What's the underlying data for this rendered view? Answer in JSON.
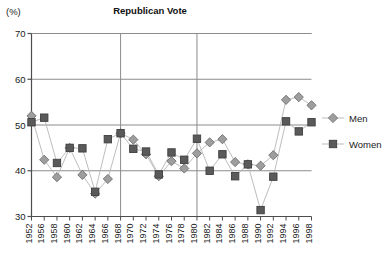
{
  "chart_data": {
    "type": "line",
    "title": "Republican Vote",
    "ylabel": "(%)",
    "xlabel": "",
    "ylim": [
      30,
      70
    ],
    "yticks": [
      30,
      40,
      50,
      60,
      70
    ],
    "grid": true,
    "legend_position": "right",
    "categories": [
      "1952",
      "1956",
      "1958",
      "1960",
      "1962",
      "1964",
      "1966",
      "1968",
      "1970",
      "1972",
      "1974",
      "1976",
      "1978",
      "1980",
      "1982",
      "1984",
      "1986",
      "1988",
      "1990",
      "1992",
      "1994",
      "1996",
      "1998"
    ],
    "series": [
      {
        "name": "Men",
        "marker": "diamond",
        "color": "#9e9e9e",
        "values": [
          52.0,
          42.4,
          38.6,
          45.0,
          39.1,
          35.0,
          38.2,
          48.2,
          46.8,
          43.6,
          38.8,
          42.1,
          40.5,
          43.8,
          46.2,
          46.9,
          41.9,
          41.4,
          41.1,
          43.4,
          55.5,
          56.1,
          54.3
        ]
      },
      {
        "name": "Women",
        "marker": "square",
        "color": "#5a5a5a",
        "values": [
          50.6,
          51.6,
          41.7,
          45.0,
          44.9,
          35.4,
          46.9,
          48.2,
          44.8,
          44.2,
          39.2,
          44.0,
          42.4,
          47.0,
          40.0,
          43.6,
          38.8,
          41.4,
          31.4,
          38.7,
          50.8,
          48.6,
          50.6
        ]
      }
    ],
    "reference_lines": [
      "1968",
      "1980"
    ],
    "annotations": []
  },
  "legend": {
    "items": [
      {
        "label": "Men"
      },
      {
        "label": "Women"
      }
    ]
  },
  "colors": {
    "men": "#9e9e9e",
    "women": "#5a5a5a",
    "axis": "#4d4d4d",
    "grid": "#8c8c8c",
    "line": "#b5b5b5"
  }
}
